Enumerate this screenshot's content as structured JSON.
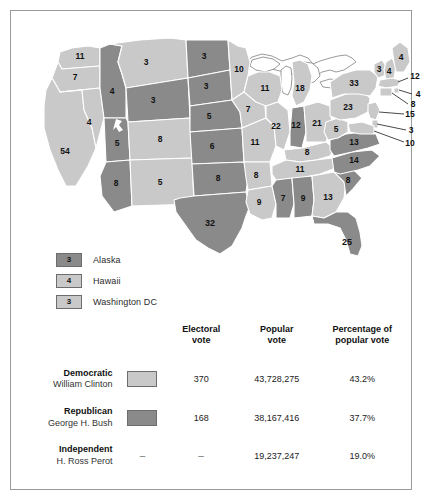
{
  "map": {
    "colors": {
      "democratic": "#c9c9c9",
      "republican": "#8a8a8a",
      "border": "#ffffff",
      "outline": "#8f8f8f",
      "water": "#ffffff"
    },
    "states": [
      {
        "code": "WA",
        "name": "Washington",
        "votes": "11",
        "winner": "democratic"
      },
      {
        "code": "OR",
        "name": "Oregon",
        "votes": "7",
        "winner": "democratic"
      },
      {
        "code": "CA",
        "name": "California",
        "votes": "54",
        "winner": "democratic"
      },
      {
        "code": "NV",
        "name": "Nevada",
        "votes": "4",
        "winner": "democratic"
      },
      {
        "code": "ID",
        "name": "Idaho",
        "votes": "4",
        "winner": "republican"
      },
      {
        "code": "MT",
        "name": "Montana",
        "votes": "3",
        "winner": "democratic"
      },
      {
        "code": "WY",
        "name": "Wyoming",
        "votes": "3",
        "winner": "republican"
      },
      {
        "code": "UT",
        "name": "Utah",
        "votes": "5",
        "winner": "republican"
      },
      {
        "code": "CO",
        "name": "Colorado",
        "votes": "8",
        "winner": "democratic"
      },
      {
        "code": "AZ",
        "name": "Arizona",
        "votes": "8",
        "winner": "republican"
      },
      {
        "code": "NM",
        "name": "New Mexico",
        "votes": "5",
        "winner": "democratic"
      },
      {
        "code": "ND",
        "name": "North Dakota",
        "votes": "3",
        "winner": "republican"
      },
      {
        "code": "SD",
        "name": "South Dakota",
        "votes": "3",
        "winner": "republican"
      },
      {
        "code": "NE",
        "name": "Nebraska",
        "votes": "5",
        "winner": "republican"
      },
      {
        "code": "KS",
        "name": "Kansas",
        "votes": "6",
        "winner": "republican"
      },
      {
        "code": "OK",
        "name": "Oklahoma",
        "votes": "8",
        "winner": "republican"
      },
      {
        "code": "TX",
        "name": "Texas",
        "votes": "32",
        "winner": "republican"
      },
      {
        "code": "MN",
        "name": "Minnesota",
        "votes": "10",
        "winner": "democratic"
      },
      {
        "code": "IA",
        "name": "Iowa",
        "votes": "7",
        "winner": "democratic"
      },
      {
        "code": "MO",
        "name": "Missouri",
        "votes": "11",
        "winner": "democratic"
      },
      {
        "code": "AR",
        "name": "Arkansas",
        "votes": "8",
        "winner": "democratic"
      },
      {
        "code": "LA",
        "name": "Louisiana",
        "votes": "9",
        "winner": "democratic"
      },
      {
        "code": "WI",
        "name": "Wisconsin",
        "votes": "11",
        "winner": "democratic"
      },
      {
        "code": "IL",
        "name": "Illinois",
        "votes": "22",
        "winner": "democratic"
      },
      {
        "code": "MI",
        "name": "Michigan",
        "votes": "18",
        "winner": "democratic"
      },
      {
        "code": "IN",
        "name": "Indiana",
        "votes": "12",
        "winner": "republican"
      },
      {
        "code": "OH",
        "name": "Ohio",
        "votes": "21",
        "winner": "democratic"
      },
      {
        "code": "KY",
        "name": "Kentucky",
        "votes": "8",
        "winner": "democratic"
      },
      {
        "code": "TN",
        "name": "Tennessee",
        "votes": "11",
        "winner": "democratic"
      },
      {
        "code": "MS",
        "name": "Mississippi",
        "votes": "7",
        "winner": "republican"
      },
      {
        "code": "AL",
        "name": "Alabama",
        "votes": "9",
        "winner": "republican"
      },
      {
        "code": "GA",
        "name": "Georgia",
        "votes": "13",
        "winner": "democratic"
      },
      {
        "code": "FL",
        "name": "Florida",
        "votes": "25",
        "winner": "republican"
      },
      {
        "code": "SC",
        "name": "South Carolina",
        "votes": "8",
        "winner": "republican"
      },
      {
        "code": "NC",
        "name": "North Carolina",
        "votes": "14",
        "winner": "republican"
      },
      {
        "code": "VA",
        "name": "Virginia",
        "votes": "13",
        "winner": "republican"
      },
      {
        "code": "WV",
        "name": "West Virginia",
        "votes": "5",
        "winner": "democratic"
      },
      {
        "code": "PA",
        "name": "Pennsylvania",
        "votes": "23",
        "winner": "democratic"
      },
      {
        "code": "NY",
        "name": "New York",
        "votes": "33",
        "winner": "democratic"
      },
      {
        "code": "VT",
        "name": "Vermont",
        "votes": "3",
        "winner": "democratic"
      },
      {
        "code": "NH",
        "name": "New Hampshire",
        "votes": "4",
        "winner": "democratic"
      },
      {
        "code": "ME",
        "name": "Maine",
        "votes": "4",
        "winner": "democratic"
      },
      {
        "code": "MA",
        "name": "Massachusetts",
        "votes": "12",
        "winner": "democratic"
      },
      {
        "code": "RI",
        "name": "Rhode Island",
        "votes": "4",
        "winner": "democratic"
      },
      {
        "code": "CT",
        "name": "Connecticut",
        "votes": "8",
        "winner": "democratic"
      },
      {
        "code": "NJ",
        "name": "New Jersey",
        "votes": "15",
        "winner": "democratic"
      },
      {
        "code": "DE",
        "name": "Delaware",
        "votes": "3",
        "winner": "democratic"
      },
      {
        "code": "MD",
        "name": "Maryland",
        "votes": "10",
        "winner": "democratic"
      }
    ],
    "legend": [
      {
        "votes": "3",
        "label": "Alaska",
        "winner": "republican"
      },
      {
        "votes": "4",
        "label": "Hawaii",
        "winner": "democratic"
      },
      {
        "votes": "3",
        "label": "Washington DC",
        "winner": "democratic"
      }
    ]
  },
  "table": {
    "headers": {
      "electoral": "Electoral\nvote",
      "electoral_line1": "Electoral",
      "electoral_line2": "vote",
      "popular_line1": "Popular",
      "popular_line2": "vote",
      "percentage_line1": "Percentage of",
      "percentage_line2": "popular vote"
    },
    "rows": [
      {
        "party": "Democratic",
        "candidate": "William Clinton",
        "swatch": "light",
        "electoral_vote": "370",
        "popular_vote": "43,728,275",
        "percentage": "43.2%"
      },
      {
        "party": "Republican",
        "candidate": "George H. Bush",
        "swatch": "dark",
        "electoral_vote": "168",
        "popular_vote": "38,167,416",
        "percentage": "37.7%"
      },
      {
        "party": "Independent",
        "candidate": "H. Ross Perot",
        "swatch": "none",
        "electoral_vote": "–",
        "popular_vote": "19,237,247",
        "percentage": "19.0%"
      }
    ]
  }
}
